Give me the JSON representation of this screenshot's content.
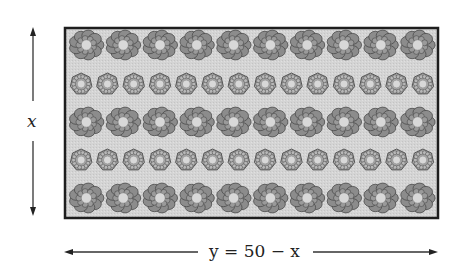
{
  "diagram": {
    "title": "",
    "vertical_dimension": {
      "label": "x",
      "direction": "both"
    },
    "horizontal_dimension": {
      "label": "y = 50 − x",
      "direction": "both"
    },
    "garden": {
      "shape": "rectangle",
      "fill_color": "#d2d2d2",
      "border_color": "#1e1e1e",
      "rows": [
        {
          "flower_type": "large-flower",
          "count": 10
        },
        {
          "flower_type": "small-flower",
          "count": 14
        },
        {
          "flower_type": "large-flower",
          "count": 10
        },
        {
          "flower_type": "small-flower",
          "count": 14
        },
        {
          "flower_type": "large-flower",
          "count": 10
        }
      ]
    },
    "colors": {
      "flower_fill": "#8c8c8c",
      "flower_outline": "#4a4a4a",
      "flower_center": "#d8d8d8",
      "arrow": "#333333"
    }
  }
}
